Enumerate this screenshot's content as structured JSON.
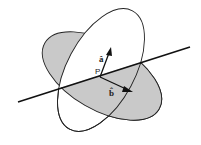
{
  "diagram": {
    "point_label": "P",
    "vector_a_label": "â",
    "vector_b_label": "b̂",
    "colors": {
      "shaded_plane": "#c9c9c9",
      "unshaded_plane": "#ffffff",
      "stroke": "#222222"
    }
  }
}
